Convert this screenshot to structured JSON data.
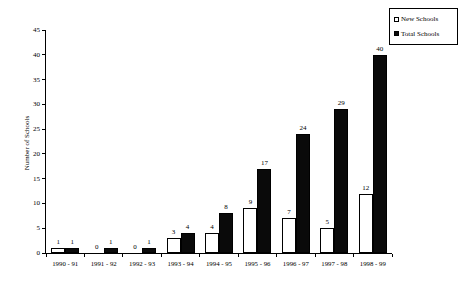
{
  "page": {
    "background": "#ffffff"
  },
  "chart_data": {
    "type": "bar",
    "title": "",
    "xlabel": "",
    "ylabel": "Number of Schools",
    "ylim": [
      0,
      45
    ],
    "ytick_step": 5,
    "yticks": [
      0,
      5,
      10,
      15,
      20,
      25,
      30,
      35,
      40,
      45
    ],
    "grid": false,
    "legend_position": "top-right",
    "axis_color": "#000000",
    "label_color": "#000000",
    "categories": [
      "1990 - 91",
      "1991 - 92",
      "1992 - 93",
      "1993 - 94",
      "1994 - 95",
      "1995 - 96",
      "1996 - 97",
      "1997 - 98",
      "1998 - 99"
    ],
    "series": [
      {
        "name": "New Schools",
        "fill": "#ffffff",
        "border": "#000000",
        "values": [
          1,
          0,
          0,
          3,
          4,
          9,
          7,
          5,
          12
        ]
      },
      {
        "name": "Total Schools",
        "fill": "#0a0a0a",
        "border": "#000000",
        "values": [
          1,
          1,
          1,
          4,
          8,
          17,
          24,
          29,
          40
        ]
      }
    ]
  }
}
